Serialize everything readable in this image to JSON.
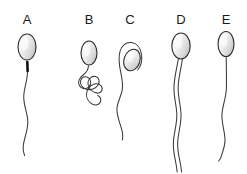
{
  "figure": {
    "background_color": "#ffffff",
    "outline_color": "#2b2b2b",
    "tail_color": "#3a3a3a",
    "midpiece_color": "#111111",
    "head_fill_light": "#fbfbfb",
    "head_fill_mid": "#e9e9e9",
    "head_fill_dark": "#c9c9c9",
    "label_color": "#1b1b1b",
    "width": 247,
    "height": 174
  },
  "panels": [
    {
      "id": "a",
      "label": "A",
      "label_x": 27,
      "label_y": 24,
      "description": "normal sperm with oval head, dark midpiece and single wavy tail",
      "head_cx": 27,
      "head_cy": 47,
      "head_rx": 9,
      "head_ry": 13,
      "has_midpiece": true,
      "tail_count": 1,
      "tail_end_y": 155
    },
    {
      "id": "b",
      "label": "B",
      "label_x": 89,
      "label_y": 24,
      "description": "sperm with tightly coiled looped tail",
      "head_cx": 89,
      "head_cy": 53,
      "head_rx": 8,
      "head_ry": 12,
      "has_midpiece": false,
      "tail_count": 1,
      "tail_end_y": 112
    },
    {
      "id": "c",
      "label": "C",
      "label_x": 130,
      "label_y": 24,
      "description": "sperm with tail coiled back over tilted head",
      "head_cx": 132,
      "head_cy": 60,
      "head_rx": 8,
      "head_ry": 11,
      "has_midpiece": false,
      "tail_count": 1,
      "tail_end_y": 140
    },
    {
      "id": "d",
      "label": "D",
      "label_x": 181,
      "label_y": 24,
      "description": "sperm with double tail",
      "head_cx": 181,
      "head_cy": 46,
      "head_rx": 9,
      "head_ry": 13,
      "has_midpiece": false,
      "tail_count": 2,
      "tail_end_y": 172
    },
    {
      "id": "e",
      "label": "E",
      "label_x": 226,
      "label_y": 24,
      "description": "sperm with thin single tail and no visible midpiece",
      "head_cx": 226,
      "head_cy": 44,
      "head_rx": 8,
      "head_ry": 12,
      "has_midpiece": false,
      "tail_count": 1,
      "tail_end_y": 160
    }
  ]
}
